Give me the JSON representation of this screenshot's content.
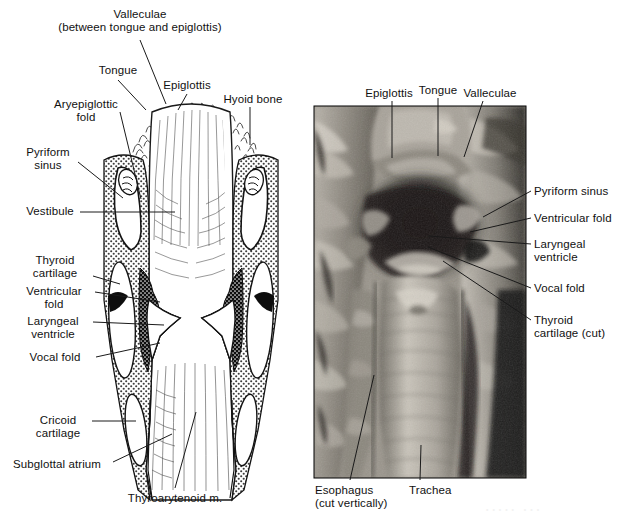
{
  "figure": {
    "type": "anatomical-illustration-plus-photograph",
    "background_color": "#ffffff",
    "text_color": "#111111",
    "panels": [
      {
        "id": "panel-left",
        "kind": "line-drawing",
        "description": "Coronal section diagram of the larynx with stippled cartilage, black muscle, and white airway"
      },
      {
        "id": "panel-right",
        "kind": "grayscale-photograph",
        "description": "Black-and-white photograph of a dissected larynx opened from behind",
        "frame": {
          "x": 314,
          "y": 106,
          "width": 212,
          "height": 372
        }
      }
    ]
  },
  "left_panel": {
    "labels": [
      {
        "key": "valleculae",
        "line1": "Valleculae",
        "line2": "(between tongue and epiglottis)",
        "x": 140,
        "y": 8,
        "align": "center",
        "leader": {
          "x1": 140,
          "y1": 40,
          "x2": 166,
          "y2": 104
        }
      },
      {
        "key": "tongue",
        "line1": "Tongue",
        "x": 118,
        "y": 64,
        "align": "center",
        "leader": {
          "x1": 118,
          "y1": 80,
          "x2": 146,
          "y2": 110
        }
      },
      {
        "key": "epiglottis",
        "line1": "Epiglottis",
        "x": 187,
        "y": 79,
        "align": "center",
        "leader": {
          "x1": 187,
          "y1": 94,
          "x2": 178,
          "y2": 110
        }
      },
      {
        "key": "hyoid-bone",
        "line1": "Hyoid bone",
        "x": 253,
        "y": 93,
        "align": "center",
        "leader": {
          "x1": 250,
          "y1": 107,
          "x2": 250,
          "y2": 145
        }
      },
      {
        "key": "aryepiglottic-fold",
        "line1": "Aryepiglottic",
        "line2": "fold",
        "x": 86,
        "y": 98,
        "align": "center",
        "leader": {
          "x1": 120,
          "y1": 112,
          "x2": 141,
          "y2": 199
        }
      },
      {
        "key": "pyriform-sinus",
        "line1": "Pyriform",
        "line2": "sinus",
        "x": 48,
        "y": 146,
        "align": "center",
        "leader": {
          "x1": 78,
          "y1": 162,
          "x2": 123,
          "y2": 198
        }
      },
      {
        "key": "vestibule",
        "line1": "Vestibule",
        "x": 50,
        "y": 205,
        "align": "center",
        "leader": {
          "x1": 80,
          "y1": 212,
          "x2": 175,
          "y2": 212
        }
      },
      {
        "key": "thyroid-cartilage",
        "line1": "Thyroid",
        "line2": "cartilage",
        "x": 55,
        "y": 254,
        "align": "center",
        "leader": {
          "x1": 93,
          "y1": 276,
          "x2": 120,
          "y2": 284
        }
      },
      {
        "key": "ventricular-fold",
        "line1": "Ventricular",
        "line2": "fold",
        "x": 54,
        "y": 285,
        "align": "center",
        "leader": {
          "x1": 95,
          "y1": 292,
          "x2": 160,
          "y2": 302
        }
      },
      {
        "key": "laryngeal-ventricle",
        "line1": "Laryngeal",
        "line2": "ventricle",
        "x": 53,
        "y": 315,
        "align": "center",
        "leader": {
          "x1": 93,
          "y1": 322,
          "x2": 164,
          "y2": 325
        }
      },
      {
        "key": "vocal-fold",
        "line1": "Vocal fold",
        "x": 55,
        "y": 351,
        "align": "center",
        "leader": {
          "x1": 96,
          "y1": 357,
          "x2": 160,
          "y2": 343
        }
      },
      {
        "key": "cricoid-cartilage",
        "line1": "Cricoid",
        "line2": "cartilage",
        "x": 58,
        "y": 414,
        "align": "center",
        "leader": {
          "x1": 92,
          "y1": 421,
          "x2": 136,
          "y2": 421
        }
      },
      {
        "key": "subglottal-atrium",
        "line1": "Subglottal atrium",
        "x": 57,
        "y": 458,
        "align": "center",
        "leader": {
          "x1": 113,
          "y1": 462,
          "x2": 172,
          "y2": 434
        }
      },
      {
        "key": "thyroarytenoid-m",
        "line1": "Thyroarytenoid m.",
        "x": 175,
        "y": 492,
        "align": "center",
        "leader": {
          "x1": 175,
          "y1": 488,
          "x2": 196,
          "y2": 412
        }
      }
    ]
  },
  "right_panel": {
    "labels": [
      {
        "key": "epiglottis",
        "line1": "Epiglottis",
        "x": 389,
        "y": 87,
        "align": "center",
        "leader": {
          "x1": 392,
          "y1": 101,
          "x2": 392,
          "y2": 158
        }
      },
      {
        "key": "tongue",
        "line1": "Tongue",
        "x": 438,
        "y": 84,
        "align": "center",
        "leader": {
          "x1": 438,
          "y1": 98,
          "x2": 438,
          "y2": 156
        }
      },
      {
        "key": "valleculae",
        "line1": "Valleculae",
        "x": 490,
        "y": 87,
        "align": "center",
        "leader": {
          "x1": 483,
          "y1": 101,
          "x2": 464,
          "y2": 157
        }
      },
      {
        "key": "pyriform-sinus",
        "line1": "Pyriform sinus",
        "x": 534,
        "y": 185,
        "align": "left",
        "leader": {
          "x1": 531,
          "y1": 191,
          "x2": 483,
          "y2": 217
        }
      },
      {
        "key": "ventricular-fold",
        "line1": "Ventricular fold",
        "x": 534,
        "y": 212,
        "align": "left",
        "leader": {
          "x1": 531,
          "y1": 218,
          "x2": 470,
          "y2": 232
        }
      },
      {
        "key": "laryngeal-ventricle",
        "line1": "Laryngeal",
        "line2": "ventricle",
        "x": 534,
        "y": 238,
        "align": "left",
        "leader": {
          "x1": 531,
          "y1": 244,
          "x2": 428,
          "y2": 236
        }
      },
      {
        "key": "vocal-fold",
        "line1": "Vocal fold",
        "x": 534,
        "y": 282,
        "align": "left",
        "leader": {
          "x1": 531,
          "y1": 288,
          "x2": 428,
          "y2": 247
        }
      },
      {
        "key": "thyroid-cartilage-cut",
        "line1": "Thyroid",
        "line2": "cartilage (cut)",
        "x": 534,
        "y": 314,
        "align": "left",
        "leader": {
          "x1": 531,
          "y1": 320,
          "x2": 443,
          "y2": 261
        }
      },
      {
        "key": "esophagus-cut-vertically",
        "line1": "Esophagus",
        "line2": "(cut vertically)",
        "x": 315,
        "y": 484,
        "align": "left",
        "leader": {
          "x1": 350,
          "y1": 480,
          "x2": 374,
          "y2": 375
        }
      },
      {
        "key": "trachea",
        "line1": "Trachea",
        "x": 409,
        "y": 484,
        "align": "left",
        "leader": {
          "x1": 420,
          "y1": 480,
          "x2": 421,
          "y2": 445
        }
      }
    ],
    "ghost_artifact": {
      "x": 486,
      "y": 506,
      "text": "• • • • •   • • •"
    }
  },
  "colors": {
    "ink": "#111111",
    "leader_line": "#1a1a1a",
    "cartilage_stipple": "#5a5a5a",
    "muscle_dark": "#2b2b2b",
    "airway_white": "#ffffff",
    "photo_shadow": "#1c1c1c",
    "photo_midtone": "#8e8a84",
    "photo_highlight": "#dedad3"
  }
}
